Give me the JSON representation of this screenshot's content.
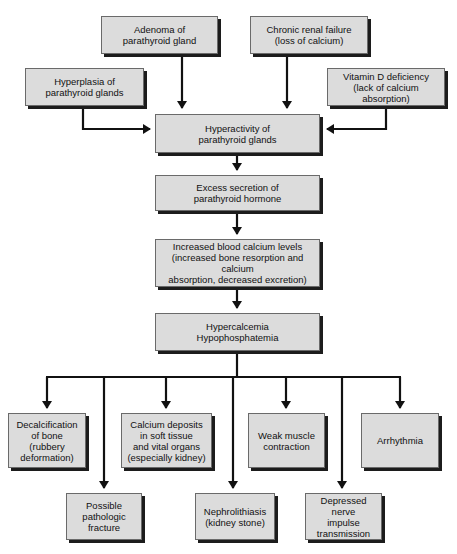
{
  "diagram": {
    "type": "flowchart",
    "causes": {
      "adenoma": "Adenoma of\nparathyroid gland",
      "renal": "Chronic renal failure\n(loss of calcium)",
      "hyperplasia": "Hyperplasia of\nparathyroid glands",
      "vitamin_d": "Vitamin D deficiency\n(lack of calcium absorption)"
    },
    "chain": {
      "hyperactivity": "Hyperactivity of\nparathyroid glands",
      "secretion": "Excess secretion of\nparathyroid hormone",
      "blood_calcium": "Increased blood calcium levels\n(increased bone resorption and calcium\nabsorption, decreased excretion)",
      "hypercalcemia": "Hypercalcemia\nHypophosphatemia"
    },
    "effects_row1": {
      "decalcification": "Decalcification\nof bone\n(rubbery\ndeformation)",
      "calcium_deposits": "Calcium deposits\nin soft tissue\nand vital organs\n(especially kidney)",
      "weak_muscle": "Weak muscle\ncontraction",
      "arrhythmia": "Arrhythmia"
    },
    "effects_row2": {
      "fracture": "Possible\npathologic\nfracture",
      "nephrolithiasis": "Nephrolithiasis\n(kidney stone)",
      "nerve": "Depressed nerve\nimpulse\ntransmission"
    },
    "colors": {
      "box_fill": "#dcdcdc",
      "box_shadow": "#1c1c1c",
      "arrow": "#111111"
    }
  }
}
